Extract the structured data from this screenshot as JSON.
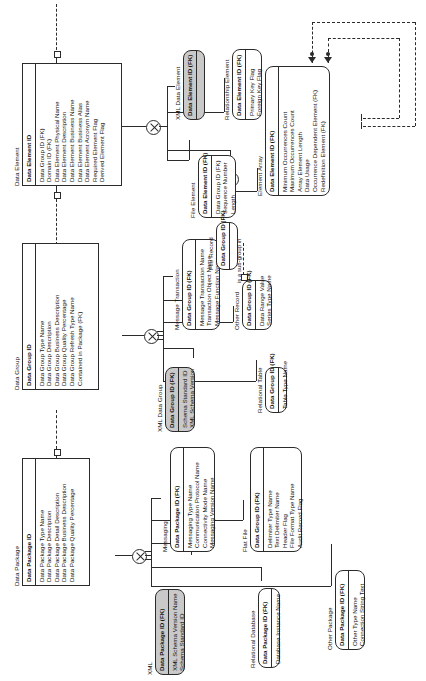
{
  "diagram": {
    "kind": "entity-relationship-diagram",
    "orientation": "rotated-90-ccw",
    "colors": {
      "line": "#2b2b2b",
      "shaded_fill": "#c9c9c9",
      "page": "#ffffff"
    }
  },
  "entities": [
    {
      "id": "data_element",
      "title": "Data Element",
      "shape": "square",
      "shaded": false,
      "pk": [
        "Data Element ID"
      ],
      "attrs": [
        "Data Group ID (FK)",
        "Domain ID (FK)",
        "Data Element Physical Name",
        "Data Element Description",
        "Data Element Business Name",
        "Data Element Business Alias",
        "Data Element Acronym Name",
        "Required Element Flag",
        "Derived Element Flag"
      ]
    },
    {
      "id": "xml_data_element",
      "title": "XML Data Element",
      "shape": "rounded",
      "shaded": true,
      "pk": [
        "Data Element ID (FK)"
      ],
      "attrs": []
    },
    {
      "id": "relationship_element",
      "title": "Relationship Element",
      "shape": "rounded",
      "shaded": false,
      "pk": [
        "Data Element ID (FK)"
      ],
      "attrs": [
        "Primary Key Flag",
        "Foreign Key Flag"
      ]
    },
    {
      "id": "file_element",
      "title": "File Element",
      "shape": "rounded",
      "shaded": false,
      "pk": [
        "Data Element ID (FK)"
      ],
      "attrs": [
        "Data Group ID (FK)",
        "Sequence Number",
        "Length"
      ]
    },
    {
      "id": "element_array",
      "title": "Element Array",
      "shape": "rounded",
      "shaded": false,
      "pk": [
        "Data Element ID (FK)"
      ],
      "attrs": [
        "Minimum Occurrences Count",
        "Maximum Occurrences Count",
        "Array Element Length",
        "Data Usage",
        "Occurrence Dependent Element (FK)",
        "Redefinition Element (FK)"
      ]
    },
    {
      "id": "data_group",
      "title": "Data Group",
      "shape": "square",
      "shaded": false,
      "pk": [
        "Data Group ID"
      ],
      "attrs": [
        "Data Group Type Name",
        "Data Group Description",
        "Data Group  Business Description",
        "Data Group Quality Percentage",
        "Data Group Refresh Type Name",
        "Contained in Package (FK)"
      ]
    },
    {
      "id": "message_transaction",
      "title": "Message Transaction",
      "shape": "rounded",
      "shaded": false,
      "pk": [
        "Data Group ID (FK)"
      ],
      "attrs": [
        "Message Transaction Name",
        "Transaction Object Name",
        "Message Function Name"
      ]
    },
    {
      "id": "file_record",
      "title": "File Record",
      "shape": "rounded",
      "shaded": false,
      "pk": [
        "Data Group ID (FK)"
      ],
      "attrs": []
    },
    {
      "id": "other_record",
      "title": "Other Record",
      "shape": "rounded",
      "shaded": false,
      "pk": [
        "Data Group ID (FK)"
      ],
      "attrs": [
        "Data Range Value",
        "Series Type Name"
      ]
    },
    {
      "id": "xml_data_group",
      "title": "XML Data Group",
      "shape": "rounded",
      "shaded": true,
      "pk": [
        "Data Group ID (FK)"
      ],
      "attrs": [
        "Schema Standard ID",
        "XML Schema Version"
      ]
    },
    {
      "id": "relational_table",
      "title": "Relational Table",
      "shape": "rounded",
      "shaded": false,
      "pk": [
        "Data Group ID (FK)"
      ],
      "attrs": [
        "Table Type Name"
      ]
    },
    {
      "id": "data_package",
      "title": "Data Package",
      "shape": "square",
      "shaded": false,
      "pk": [
        "Data Package ID"
      ],
      "attrs": [
        "Data Package Type Name",
        "Data Package Description",
        "Data Package Detail Description",
        "Data Package Business Description",
        "Data Package Quality Percentage"
      ]
    },
    {
      "id": "messaging",
      "title": "Messaging",
      "shape": "rounded",
      "shaded": false,
      "pk": [
        "Data Package ID (FK)"
      ],
      "attrs": [
        "Messaging Type Name",
        "Communication Protocol Name",
        "Connectivity Mode Name",
        "Messaging Version Name"
      ]
    },
    {
      "id": "flat_file",
      "title": "Flat File",
      "shape": "rounded",
      "shaded": false,
      "pk": [
        "Data Group ID (FK)"
      ],
      "attrs": [
        "Delimiter Type Name",
        "Text Delimiter Name",
        "Header Flag",
        "File Format Type Name",
        "Audit Record Flag"
      ]
    },
    {
      "id": "xml",
      "title": "XML",
      "shape": "rounded",
      "shaded": true,
      "pk": [
        "Data Package ID (FK)"
      ],
      "attrs": [
        "XML Schema Version Name",
        "Schema Standard ID"
      ]
    },
    {
      "id": "relational_database",
      "title": "Relational Database",
      "shape": "rounded",
      "shaded": false,
      "pk": [
        "Data Package ID (FK)"
      ],
      "attrs": [
        "Database Instance Name"
      ]
    },
    {
      "id": "other_package",
      "title": "Other Package",
      "shape": "rounded",
      "shaded": false,
      "pk": [
        "Data Package ID (FK)"
      ],
      "attrs": [
        "Other Type Name",
        "Connection String Text"
      ]
    }
  ],
  "relationship_labels": [
    {
      "id": "sub_group_label",
      "text": "is a sub-group in"
    }
  ]
}
